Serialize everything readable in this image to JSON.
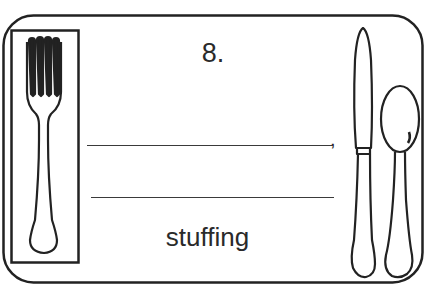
{
  "card": {
    "item_number": "8.",
    "blank_lines": [
      {
        "id": "blank-1",
        "value": "",
        "trailing_punctuation": ","
      },
      {
        "id": "blank-2",
        "value": ""
      }
    ],
    "word": "stuffing",
    "comma": ","
  },
  "illustrations": {
    "left": "fork-icon",
    "right": [
      "knife-icon",
      "spoon-icon"
    ]
  },
  "colors": {
    "ink": "#2a2a2a",
    "background": "#ffffff"
  }
}
